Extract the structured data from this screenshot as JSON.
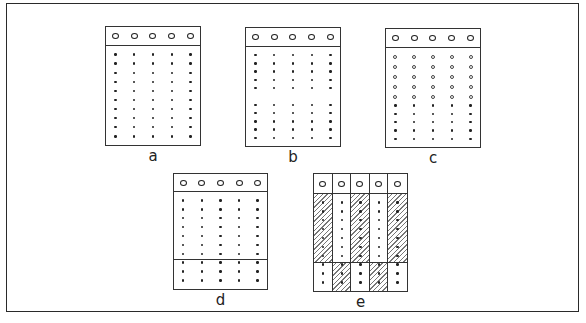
{
  "figure": {
    "panels": [
      {
        "id": "a",
        "label": "a",
        "left": 105,
        "top": 26,
        "width": 96,
        "height": 120,
        "header_h": 19,
        "columns": 5,
        "rows": [
          {
            "type": "dot",
            "count": 10
          }
        ],
        "divider": null
      },
      {
        "id": "b",
        "label": "b",
        "left": 245,
        "top": 27,
        "width": 96,
        "height": 120,
        "header_h": 19,
        "columns": 5,
        "rows": [
          {
            "type": "dot",
            "count": 5
          },
          {
            "type": "gap",
            "count": 1
          },
          {
            "type": "dot",
            "count": 5
          }
        ],
        "divider": null
      },
      {
        "id": "c",
        "label": "c",
        "left": 385,
        "top": 28,
        "width": 96,
        "height": 120,
        "header_h": 19,
        "columns": 5,
        "rows": [
          {
            "type": "ring",
            "count": 5
          },
          {
            "type": "dot",
            "count": 5
          }
        ],
        "divider": null
      },
      {
        "id": "d",
        "label": "d",
        "left": 173,
        "top": 173,
        "width": 95,
        "height": 117,
        "header_h": 18,
        "columns": 5,
        "rows": [
          {
            "type": "dot",
            "count": 10
          }
        ],
        "divider": 67
      },
      {
        "id": "e",
        "label": "e",
        "left": 313,
        "top": 173,
        "width": 95,
        "height": 119,
        "header_h": 20,
        "columns": 5,
        "rows": [
          {
            "type": "dot",
            "count": 10
          }
        ],
        "divider": 68,
        "hatched_top": [
          0,
          2,
          4
        ],
        "hatched_bottom": [
          1,
          3
        ]
      }
    ],
    "labels": {
      "a": "a",
      "b": "b",
      "c": "c",
      "d": "d",
      "e": "e"
    },
    "caption": "Fig. 15"
  }
}
